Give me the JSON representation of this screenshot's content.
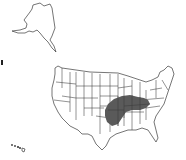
{
  "map": {
    "title": "",
    "subject": "United States range map",
    "regions_shown": [
      "Contiguous United States",
      "Alaska",
      "Hawaii"
    ],
    "shaded_region": {
      "description": "Range area covering central-eastern US",
      "approx_states": [
        "Missouri",
        "Arkansas",
        "Illinois",
        "Indiana",
        "Kentucky",
        "Tennessee",
        "Oklahoma (east)",
        "Ohio (south)"
      ],
      "color": "#5a5a5a"
    },
    "colors": {
      "background": "#ffffff",
      "land": "#ffffff",
      "borders": "#3a3a3a",
      "range": "#5a5a5a"
    }
  }
}
